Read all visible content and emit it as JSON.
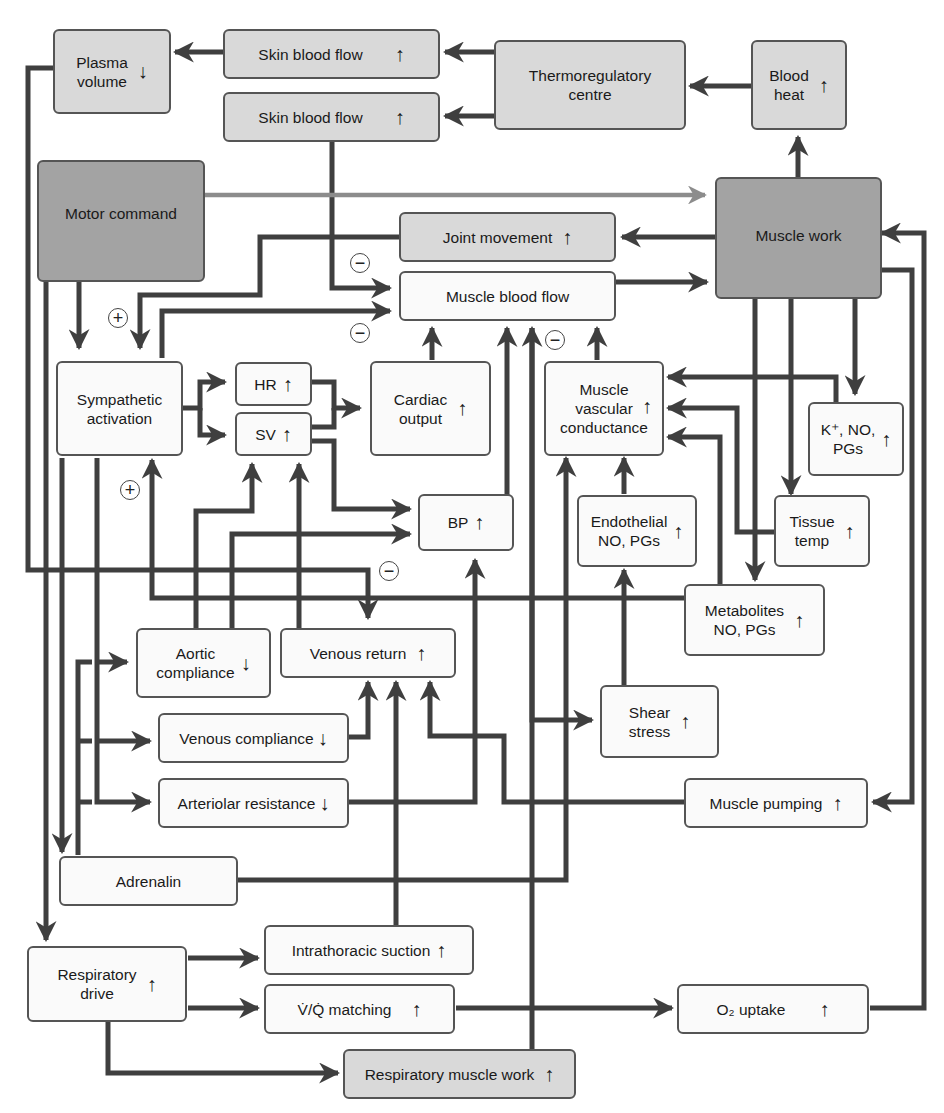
{
  "nodes": {
    "plasma_volume": {
      "label": "Plasma\nvolume",
      "direction": "↓"
    },
    "skin_blood_flow_1": {
      "label": "Skin blood flow",
      "direction": "↑"
    },
    "skin_blood_flow_2": {
      "label": "Skin blood flow",
      "direction": "↑"
    },
    "thermoregulatory_centre": {
      "label": "Thermoregulatory\ncentre",
      "direction": ""
    },
    "blood_heat": {
      "label": "Blood\nheat",
      "direction": "↑"
    },
    "motor_command": {
      "label": "Motor command",
      "direction": ""
    },
    "muscle_work": {
      "label": "Muscle work",
      "direction": ""
    },
    "joint_movement": {
      "label": "Joint movement",
      "direction": "↑"
    },
    "muscle_blood_flow": {
      "label": "Muscle blood flow",
      "direction": ""
    },
    "sympathetic_activation": {
      "label": "Sympathetic\nactivation",
      "direction": ""
    },
    "hr": {
      "label": "HR",
      "direction": "↑"
    },
    "sv": {
      "label": "SV",
      "direction": "↑"
    },
    "cardiac_output": {
      "label": "Cardiac\noutput",
      "direction": "↑"
    },
    "muscle_vascular_conductance": {
      "label": "Muscle\nvascular\nconductance",
      "direction": "↑"
    },
    "k_no_pgs": {
      "label": "K⁺, NO,\nPGs",
      "direction": "↑"
    },
    "bp": {
      "label": "BP",
      "direction": "↑"
    },
    "endothelial_no_pgs": {
      "label": "Endothelial\nNO, PGs",
      "direction": "↑"
    },
    "tissue_temp": {
      "label": "Tissue\ntemp",
      "direction": "↑"
    },
    "metabolites": {
      "label": "Metabolites\nNO, PGs",
      "direction": "↑"
    },
    "aortic_compliance": {
      "label": "Aortic\ncompliance",
      "direction": "↓"
    },
    "venous_return": {
      "label": "Venous return",
      "direction": "↑"
    },
    "shear_stress": {
      "label": "Shear\nstress",
      "direction": "↑"
    },
    "venous_compliance": {
      "label": "Venous compliance",
      "direction": "↓"
    },
    "arteriolar_resistance": {
      "label": "Arteriolar resistance",
      "direction": "↓"
    },
    "muscle_pumping": {
      "label": "Muscle pumping",
      "direction": "↑"
    },
    "adrenalin": {
      "label": "Adrenalin",
      "direction": ""
    },
    "respiratory_drive": {
      "label": "Respiratory\ndrive",
      "direction": "↑"
    },
    "intrathoracic_suction": {
      "label": "Intrathoracic suction",
      "direction": "↑"
    },
    "vq_matching": {
      "label": "V̇/Q̇ matching",
      "direction": "↑"
    },
    "o2_uptake": {
      "label": "O₂ uptake",
      "direction": "↑"
    },
    "respiratory_muscle_work": {
      "label": "Respiratory muscle work",
      "direction": "↑"
    }
  },
  "signs": {
    "minus_1": "−",
    "minus_2": "−",
    "minus_3": "−",
    "minus_4": "−",
    "plus_1": "+",
    "plus_2": "+"
  },
  "colors": {
    "wire": "#3f3f3f",
    "wire_motor": "#8c8c8c",
    "box_dark": "#a3a3a3",
    "box_light": "#d9d9d9",
    "box_white": "#fafafa"
  }
}
